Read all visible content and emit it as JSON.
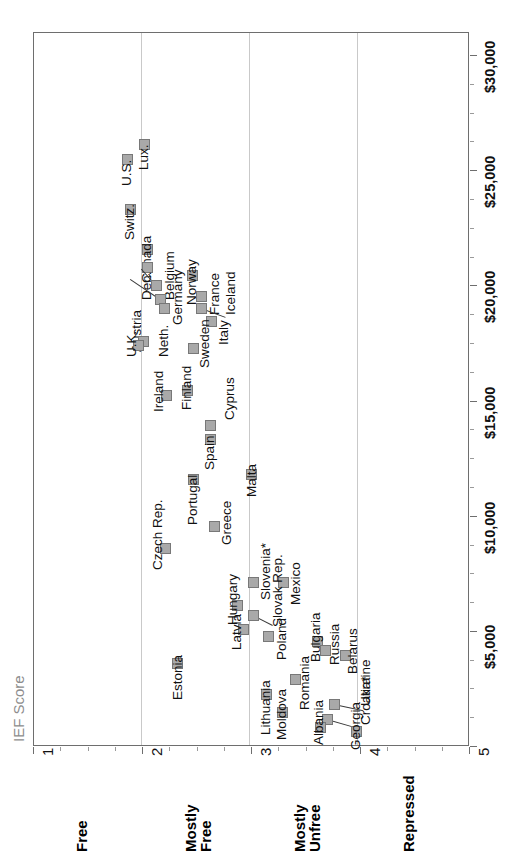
{
  "chart_data": {
    "type": "scatter",
    "title": "",
    "xlabel": "IEF Score",
    "ylabel": "",
    "xlim": [
      1,
      5
    ],
    "ylim": [
      0,
      31000
    ],
    "grid": "vertical gridlines at IEF 2, 3 and 4",
    "legend": "none",
    "x_tick_labels": [
      "1",
      "2",
      "3",
      "4",
      "5"
    ],
    "x_tick_values": [
      1,
      2,
      3,
      4,
      5
    ],
    "y_tick_labels": [
      "$5,000",
      "$10,000",
      "$15,000",
      "$20,000",
      "$25,000",
      "$30,000"
    ],
    "y_tick_values": [
      5000,
      10000,
      15000,
      20000,
      25000,
      30000
    ],
    "band_labels": [
      "Free",
      "Mostly Free",
      "Mostly Unfree",
      "Repressed"
    ],
    "bands": [
      {
        "label": "Free",
        "range": [
          1,
          2
        ]
      },
      {
        "label": "Mostly\nFree",
        "range": [
          2,
          3
        ]
      },
      {
        "label": "Mostly\nUnfree",
        "range": [
          3,
          4
        ]
      },
      {
        "label": "Repressed",
        "range": [
          4,
          5
        ]
      }
    ],
    "point_color": "#a9a9a9",
    "point_border_color": "#787878",
    "points": [
      {
        "name": "U.S.",
        "ief": 1.9,
        "gdp": 24900,
        "lx": 122,
        "ly": 154,
        "tx": 119,
        "ty": 186,
        "leader": false
      },
      {
        "name": "Lux.",
        "ief": 2.03,
        "gdp": 25600,
        "lx": 139,
        "ly": 139,
        "tx": 136,
        "ty": 170,
        "leader": false
      },
      {
        "name": "Switz.",
        "ief": 1.92,
        "gdp": 22500,
        "lx": 125,
        "ly": 204,
        "tx": 122,
        "ty": 240,
        "leader": false
      },
      {
        "name": "Canada",
        "ief": 2.06,
        "gdp": 21000,
        "lx": 142,
        "ly": 244,
        "tx": 139,
        "ty": 283,
        "leader": false
      },
      {
        "name": "Den.",
        "ief": 2.06,
        "gdp": 20500,
        "lx": 142,
        "ly": 262,
        "tx": 139,
        "ty": 300,
        "leader": false
      },
      {
        "name": "Belgium",
        "ief": 2.14,
        "gdp": 19900,
        "lx": 151,
        "ly": 280,
        "tx": 162,
        "ty": 300,
        "leader": true,
        "llen": 22,
        "lrot": 228
      },
      {
        "name": "Austria",
        "ief": 2.18,
        "gdp": 19500,
        "lx": 155,
        "ly": 294,
        "tx": 129,
        "ty": 352,
        "leader": true,
        "llen": 36,
        "lrot": 214
      },
      {
        "name": "Germany",
        "ief": 2.22,
        "gdp": 19200,
        "lx": 159,
        "ly": 303,
        "tx": 170,
        "ty": 325,
        "leader": false
      },
      {
        "name": "Norway",
        "ief": 2.3,
        "gdp": 20200,
        "lx": 187,
        "ly": 270,
        "tx": 184,
        "ty": 305,
        "leader": false
      },
      {
        "name": "France",
        "ief": 2.35,
        "gdp": 19300,
        "lx": 196,
        "ly": 291,
        "tx": 207,
        "ty": 315,
        "leader": false
      },
      {
        "name": "Iceland",
        "ief": 2.35,
        "gdp": 18900,
        "lx": 196,
        "ly": 303,
        "tx": 223,
        "ty": 315,
        "leader": true,
        "llen": 26,
        "lrot": 20
      },
      {
        "name": "Italy",
        "ief": 2.42,
        "gdp": 18500,
        "lx": 206,
        "ly": 316,
        "tx": 216,
        "ty": 345,
        "leader": false
      },
      {
        "name": "Neth.",
        "ief": 2.02,
        "gdp": 18000,
        "lx": 138,
        "ly": 336,
        "tx": 156,
        "ty": 357,
        "leader": false
      },
      {
        "name": "U.K.",
        "ief": 1.98,
        "gdp": 17800,
        "lx": 133,
        "ly": 340,
        "tx": 124,
        "ty": 357,
        "leader": false
      },
      {
        "name": "Sweden",
        "ief": 2.22,
        "gdp": 17700,
        "lx": 188,
        "ly": 343,
        "tx": 197,
        "ty": 368,
        "leader": false
      },
      {
        "name": "Finland",
        "ief": 2.25,
        "gdp": 16200,
        "lx": 182,
        "ly": 385,
        "tx": 179,
        "ty": 410,
        "leader": false
      },
      {
        "name": "Ireland",
        "ief": 2.08,
        "gdp": 15800,
        "lx": 161,
        "ly": 390,
        "tx": 151,
        "ty": 412,
        "leader": false
      },
      {
        "name": "Cyprus",
        "ief": 2.38,
        "gdp": 14200,
        "lx": 205,
        "ly": 420,
        "tx": 222,
        "ty": 420,
        "leader": false
      },
      {
        "name": "Spain",
        "ief": 2.38,
        "gdp": 13800,
        "lx": 205,
        "ly": 434,
        "tx": 202,
        "ty": 470,
        "leader": false
      },
      {
        "name": "Portugal",
        "ief": 2.3,
        "gdp": 12300,
        "lx": 188,
        "ly": 474,
        "tx": 185,
        "ty": 525,
        "leader": false
      },
      {
        "name": "Malta",
        "ief": 2.55,
        "gdp": 11900,
        "lx": 246,
        "ly": 469,
        "tx": 244,
        "ty": 497,
        "leader": false
      },
      {
        "name": "Greece",
        "ief": 2.42,
        "gdp": 10200,
        "lx": 209,
        "ly": 521,
        "tx": 219,
        "ty": 545,
        "leader": false
      },
      {
        "name": "Czech Rep.",
        "ief": 2.1,
        "gdp": 9200,
        "lx": 160,
        "ly": 543,
        "tx": 150,
        "ty": 570,
        "leader": false
      },
      {
        "name": "Slovenia*",
        "ief": 2.58,
        "gdp": 7000,
        "lx": 248,
        "ly": 577,
        "tx": 258,
        "ty": 600,
        "leader": false
      },
      {
        "name": "Hungary",
        "ief": 2.53,
        "gdp": 6000,
        "lx": 232,
        "ly": 600,
        "tx": 225,
        "ty": 625,
        "leader": false
      },
      {
        "name": "Mexico",
        "ief": 2.68,
        "gdp": 6800,
        "lx": 278,
        "ly": 577,
        "tx": 288,
        "ty": 605,
        "leader": false
      },
      {
        "name": "Latvia",
        "ief": 2.52,
        "gdp": 5300,
        "lx": 238,
        "ly": 624,
        "tx": 229,
        "ty": 650,
        "leader": false
      },
      {
        "name": "Slovak Rep.",
        "ief": 2.6,
        "gdp": 5400,
        "lx": 248,
        "ly": 610,
        "tx": 270,
        "ty": 627,
        "leader": true,
        "llen": 22,
        "lrot": 27
      },
      {
        "name": "Estonia",
        "ief": 2.2,
        "gdp": 4700,
        "lx": 172,
        "ly": 658,
        "tx": 170,
        "ty": 700,
        "leader": false
      },
      {
        "name": "Poland",
        "ief": 2.72,
        "gdp": 5200,
        "lx": 263,
        "ly": 631,
        "tx": 274,
        "ty": 660,
        "leader": false
      },
      {
        "name": "Bulgaria",
        "ief": 3.02,
        "gdp": 5000,
        "lx": 312,
        "ly": 636,
        "tx": 308,
        "ty": 662,
        "leader": false
      },
      {
        "name": "Russia",
        "ief": 3.1,
        "gdp": 4900,
        "lx": 320,
        "ly": 645,
        "tx": 327,
        "ty": 665,
        "leader": false
      },
      {
        "name": "Belarus",
        "ief": 3.22,
        "gdp": 4700,
        "lx": 340,
        "ly": 650,
        "tx": 345,
        "ty": 674,
        "leader": false
      },
      {
        "name": "Romania",
        "ief": 2.9,
        "gdp": 4000,
        "lx": 290,
        "ly": 674,
        "tx": 297,
        "ty": 710,
        "leader": false
      },
      {
        "name": "Lithuania",
        "ief": 2.7,
        "gdp": 3500,
        "lx": 261,
        "ly": 689,
        "tx": 258,
        "ty": 735,
        "leader": false
      },
      {
        "name": "Moldova",
        "ief": 2.82,
        "gdp": 3200,
        "lx": 277,
        "ly": 707,
        "tx": 274,
        "ty": 740,
        "leader": false
      },
      {
        "name": "Ukraine",
        "ief": 3.18,
        "gdp": 3400,
        "lx": 329,
        "ly": 699,
        "tx": 358,
        "ty": 706,
        "leader": true,
        "llen": 30,
        "lrot": 12
      },
      {
        "name": "Croatia*",
        "ief": 3.12,
        "gdp": 3000,
        "lx": 322,
        "ly": 714,
        "tx": 358,
        "ty": 725,
        "leader": true,
        "llen": 34,
        "lrot": 16
      },
      {
        "name": "Albania",
        "ief": 3.06,
        "gdp": 2800,
        "lx": 315,
        "ly": 722,
        "tx": 311,
        "ty": 745,
        "leader": false
      },
      {
        "name": "Georgia",
        "ief": 3.32,
        "gdp": 2600,
        "lx": 351,
        "ly": 726,
        "tx": 348,
        "ty": 750,
        "leader": false
      }
    ]
  },
  "axis": {
    "title": "IEF Score",
    "title_color": "#8d8d8d"
  }
}
